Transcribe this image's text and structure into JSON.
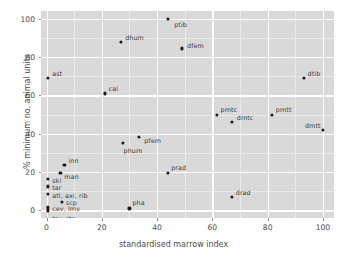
{
  "chart_data": {
    "type": "scatter",
    "title": "",
    "xlabel": "standardised marrow index",
    "ylabel": "% minimum no. animal units",
    "xlim": [
      -2,
      104
    ],
    "ylim": [
      -4,
      104
    ],
    "xticks": [
      0,
      20,
      40,
      60,
      80,
      100
    ],
    "yticks": [
      0,
      20,
      40,
      60,
      80,
      100
    ],
    "grid": true,
    "legend": "none",
    "points": [
      {
        "label": "ptib",
        "x": 44,
        "y": 100,
        "lx": 6,
        "ly": 3
      },
      {
        "label": "dhum",
        "x": 27,
        "y": 88,
        "lx": 4,
        "ly": -7
      },
      {
        "label": "dfem",
        "x": 49,
        "y": 84.5,
        "lx": 5,
        "ly": -5
      },
      {
        "label": "ast",
        "x": 0.6,
        "y": 69,
        "lx": 4,
        "ly": -7
      },
      {
        "label": "dtib",
        "x": 93,
        "y": 69,
        "lx": 4,
        "ly": -7
      },
      {
        "label": "cal",
        "x": 21,
        "y": 61,
        "lx": 4,
        "ly": -7
      },
      {
        "label": "pmtc",
        "x": 61.5,
        "y": 50,
        "lx": 4,
        "ly": -8
      },
      {
        "label": "pmtt",
        "x": 81.5,
        "y": 50,
        "lx": 4,
        "ly": -8
      },
      {
        "label": "dmtc",
        "x": 67,
        "y": 46,
        "lx": 5,
        "ly": -7
      },
      {
        "label": "dmtt",
        "x": 100,
        "y": 42,
        "lx": -18,
        "ly": -7
      },
      {
        "label": "pfem",
        "x": 33.5,
        "y": 38.5,
        "lx": 5,
        "ly": 1
      },
      {
        "label": "phum",
        "x": 27.5,
        "y": 35,
        "lx": 1,
        "ly": 5
      },
      {
        "label": "inn",
        "x": 6.5,
        "y": 23.5,
        "lx": 4,
        "ly": -7
      },
      {
        "label": "prad",
        "x": 44,
        "y": 19.5,
        "lx": 3,
        "ly": -8
      },
      {
        "label": "man",
        "x": 5,
        "y": 19.5,
        "lx": 4,
        "ly": 1
      },
      {
        "label": "skl",
        "x": 0.6,
        "y": 16.5,
        "lx": 4,
        "ly": -1
      },
      {
        "label": "tar",
        "x": 0.6,
        "y": 12.5,
        "lx": 4,
        "ly": -1
      },
      {
        "label": "atl, axi, rib",
        "x": 0.6,
        "y": 8.5,
        "lx": 4,
        "ly": -1
      },
      {
        "label": "drad",
        "x": 67,
        "y": 7,
        "lx": 4,
        "ly": -7
      },
      {
        "label": "scp",
        "x": 5.5,
        "y": 4.5,
        "lx": 4,
        "ly": -2
      },
      {
        "label": "cev, lmv",
        "x": 0.6,
        "y": 1.5,
        "lx": 4,
        "ly": -1
      },
      {
        "label": "pha",
        "x": 30,
        "y": 1,
        "lx": 3,
        "ly": -8
      },
      {
        "label": "trv, stn",
        "x": 0.6,
        "y": 0,
        "lx": 4,
        "ly": 6
      }
    ],
    "colors": {
      "panel": "#d9d9d9",
      "grid_major": "#ffffff",
      "grid_minor": "#eaeaea",
      "point": "#1a1a1a",
      "text": "#4d4d4d",
      "background": "#ffffff"
    }
  }
}
